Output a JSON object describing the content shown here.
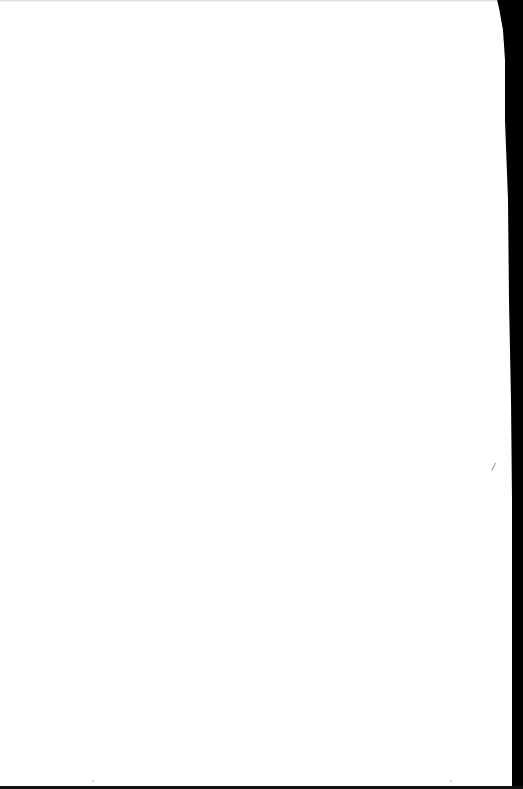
{
  "document": {
    "type": "blank scanned page",
    "text_content": "",
    "edge_mark": "/"
  },
  "colors": {
    "paper": "#ffffff",
    "scan_border": "#000000"
  }
}
